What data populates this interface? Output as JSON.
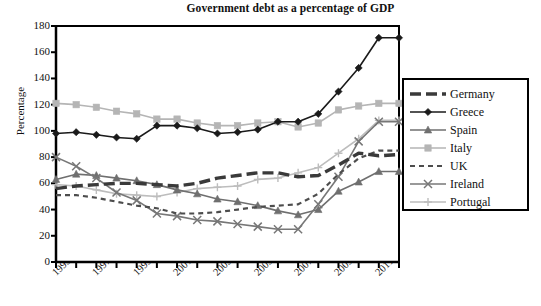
{
  "chart_data": {
    "type": "line",
    "title": "Government debt as a percentage of GDP",
    "xlabel": "",
    "ylabel": "Percentage",
    "ylim": [
      0,
      180
    ],
    "ytick_step": 20,
    "yticks": [
      0,
      20,
      40,
      60,
      80,
      100,
      120,
      140,
      160,
      180
    ],
    "grid": false,
    "legend_position": "right",
    "x": [
      1995,
      1996,
      1997,
      1998,
      1999,
      2000,
      2001,
      2002,
      2003,
      2004,
      2005,
      2006,
      2007,
      2008,
      2009,
      2010,
      2011,
      2012
    ],
    "xtick_labels": [
      "1995",
      "1997",
      "1999",
      "2001",
      "2003",
      "2005",
      "2007",
      "2009",
      "2011"
    ],
    "xtick_values": [
      1995,
      1997,
      1999,
      2001,
      2003,
      2005,
      2007,
      2009,
      2011
    ],
    "series": [
      {
        "name": "Germany",
        "color": "#3a3a3a",
        "style": "thick-dashed",
        "marker": "none",
        "values": [
          56,
          58,
          59,
          60,
          60,
          59,
          58,
          60,
          64,
          66,
          68,
          68,
          65,
          66,
          74,
          83,
          81,
          82
        ]
      },
      {
        "name": "Greece",
        "color": "#1a1a1a",
        "style": "solid",
        "marker": "diamond",
        "values": [
          98,
          99,
          97,
          95,
          94,
          104,
          104,
          102,
          98,
          99,
          101,
          107,
          107,
          113,
          130,
          148,
          171,
          171
        ]
      },
      {
        "name": "Spain",
        "color": "#6f6f6f",
        "style": "solid",
        "marker": "triangle",
        "values": [
          63,
          67,
          66,
          64,
          62,
          59,
          55,
          52,
          48,
          46,
          43,
          39,
          36,
          40,
          54,
          61,
          69,
          69
        ]
      },
      {
        "name": "Italy",
        "color": "#b5b5b5",
        "style": "solid",
        "marker": "square",
        "values": [
          121,
          120,
          118,
          115,
          113,
          109,
          109,
          106,
          104,
          104,
          106,
          107,
          103,
          106,
          116,
          119,
          121,
          121
        ]
      },
      {
        "name": "UK",
        "color": "#4d4d4d",
        "style": "dashed",
        "marker": "none",
        "values": [
          51,
          51,
          49,
          46,
          43,
          41,
          37,
          37,
          38,
          40,
          42,
          43,
          44,
          52,
          67,
          79,
          85,
          85
        ]
      },
      {
        "name": "Ireland",
        "color": "#777777",
        "style": "solid",
        "marker": "cross",
        "values": [
          80,
          73,
          64,
          53,
          47,
          37,
          35,
          32,
          31,
          29,
          27,
          25,
          25,
          44,
          65,
          92,
          107,
          107
        ]
      },
      {
        "name": "Portugal",
        "color": "#bdbdbd",
        "style": "solid",
        "marker": "plus",
        "values": [
          59,
          58,
          55,
          52,
          51,
          50,
          53,
          56,
          57,
          58,
          63,
          64,
          68,
          72,
          83,
          94,
          108,
          108
        ]
      }
    ]
  },
  "axis": {
    "y_label": "Percentage",
    "y_ticks": [
      "180",
      "160",
      "140",
      "120",
      "100",
      "80",
      "60",
      "40",
      "20",
      "0"
    ],
    "x_ticks": [
      "1995",
      "1997",
      "1999",
      "2001",
      "2003",
      "2005",
      "2007",
      "2009",
      "2011"
    ]
  },
  "legend": {
    "items": [
      {
        "label": "Germany"
      },
      {
        "label": "Greece"
      },
      {
        "label": "Spain"
      },
      {
        "label": "Italy"
      },
      {
        "label": "UK"
      },
      {
        "label": "Ireland"
      },
      {
        "label": "Portugal"
      }
    ]
  }
}
